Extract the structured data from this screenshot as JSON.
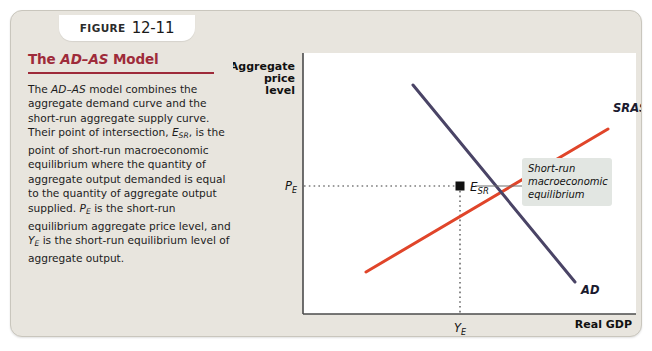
{
  "figure": {
    "label_word": "Figure",
    "number": "12-11"
  },
  "caption": {
    "title_prefix": "The ",
    "title_italic": "AD–AS",
    "title_suffix": " Model",
    "body_html": "The <em>AD–AS</em> model combines the aggregate demand curve and the short-run aggregate supply curve. Their point of intersection, <em>E</em><span class=\"sub\">SR</span>, is the point of short-run macroeconomic equilibrium where the quantity of aggregate output demanded is equal to the quantity of aggregate output supplied. <em>P</em><span class=\"sub\">E</span> is the short-run equilibrium aggregate price level, and <em>Y</em><span class=\"sub\">E</span> is the short-run equilibrium level of aggregate output."
  },
  "chart_data": {
    "type": "line",
    "title": "The AD–AS Model",
    "ylabel_lines": [
      "Aggregate",
      "price",
      "level"
    ],
    "xlabel": "Real GDP",
    "axis_ranges": {
      "x": [
        0,
        1
      ],
      "y": [
        0,
        1
      ]
    },
    "grid": false,
    "legend": "inline-curve-labels",
    "series": [
      {
        "name": "SRAS",
        "label": "SRAS",
        "color": "#e0452a",
        "description": "Short-run aggregate supply curve, upward sloping",
        "points": [
          [
            0.19,
            0.2
          ],
          [
            0.92,
            0.75
          ]
        ]
      },
      {
        "name": "AD",
        "label": "AD",
        "color": "#4a4466",
        "description": "Aggregate demand curve, downward sloping",
        "points": [
          [
            0.33,
            0.88
          ],
          [
            0.82,
            0.12
          ]
        ]
      }
    ],
    "equilibrium": {
      "point_label": "E",
      "point_sub": "SR",
      "x_tick_label": "Y",
      "x_tick_sub": "E",
      "y_tick_label": "P",
      "y_tick_sub": "E",
      "x": 0.54,
      "y": 0.55,
      "marker": "square"
    },
    "annotation": {
      "lines": [
        "Short-run",
        "macroeconomic",
        "equilibrium"
      ]
    }
  }
}
